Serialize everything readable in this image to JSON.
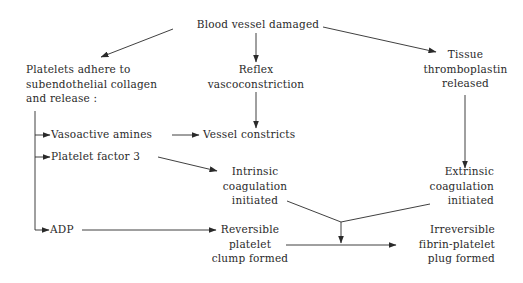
{
  "diagram": {
    "type": "flowchart",
    "nodes": {
      "blood_vessel_damaged": {
        "lines": [
          "Blood vessel damaged"
        ]
      },
      "platelets_adhere": {
        "lines": [
          "Platelets adhere to",
          "subendothelial collagen",
          "and release :"
        ]
      },
      "reflex": {
        "lines": [
          "Reflex",
          "vascoconstriction"
        ]
      },
      "tissue_thromboplastin": {
        "lines": [
          "Tissue",
          "thromboplastin",
          "released"
        ]
      },
      "vasoactive_amines": {
        "lines": [
          "Vasoactive amines"
        ]
      },
      "vessel_constricts": {
        "lines": [
          "Vessel constricts"
        ]
      },
      "platelet_factor_3": {
        "lines": [
          "Platelet factor 3"
        ]
      },
      "intrinsic": {
        "lines": [
          "Intrinsic",
          "coagulation",
          "initiated"
        ]
      },
      "extrinsic": {
        "lines": [
          "Extrinsic",
          "coagulation",
          "initiated"
        ]
      },
      "adp": {
        "lines": [
          "ADP"
        ]
      },
      "reversible": {
        "lines": [
          "Reversible",
          "platelet",
          "clump formed"
        ]
      },
      "irreversible": {
        "lines": [
          "Irreversible",
          "fibrin-platelet",
          "plug formed"
        ]
      }
    },
    "edges": [
      {
        "from": "blood_vessel_damaged",
        "to": "platelets_adhere"
      },
      {
        "from": "blood_vessel_damaged",
        "to": "reflex"
      },
      {
        "from": "blood_vessel_damaged",
        "to": "tissue_thromboplastin"
      },
      {
        "from": "platelets_adhere",
        "to": "vasoactive_amines"
      },
      {
        "from": "platelets_adhere",
        "to": "platelet_factor_3"
      },
      {
        "from": "platelets_adhere",
        "to": "adp"
      },
      {
        "from": "reflex",
        "to": "vessel_constricts"
      },
      {
        "from": "vasoactive_amines",
        "to": "vessel_constricts"
      },
      {
        "from": "platelet_factor_3",
        "to": "intrinsic"
      },
      {
        "from": "tissue_thromboplastin",
        "to": "extrinsic"
      },
      {
        "from": "adp",
        "to": "reversible"
      },
      {
        "from": "intrinsic",
        "to": "irreversible",
        "via": "merge"
      },
      {
        "from": "extrinsic",
        "to": "irreversible",
        "via": "merge"
      },
      {
        "from": "reversible",
        "to": "irreversible"
      }
    ]
  }
}
